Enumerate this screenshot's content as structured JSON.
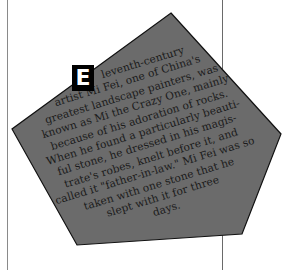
{
  "shape": {
    "fill": "#6b6b6b",
    "stroke": "#111111",
    "points": [
      [
        171,
        13
      ],
      [
        281,
        134
      ],
      [
        242,
        234
      ],
      [
        77,
        245
      ],
      [
        12,
        129
      ]
    ]
  },
  "dropcap": {
    "letter": "E"
  },
  "passage": {
    "lines": [
      "leventh-century",
      "artist Mi Fei, one of China's",
      "greatest landscape painters, was",
      "known as Mi the Crazy One, mainly",
      "because of his adoration of rocks.",
      "When he found a particularly beauti-",
      "ful stone, he dressed in his magis-",
      "trate's robes, knelt before it, and",
      "called it \"father-in-law.\" Mi Fei was so",
      "taken with one stone that he",
      "slept with it for three",
      "days."
    ]
  }
}
